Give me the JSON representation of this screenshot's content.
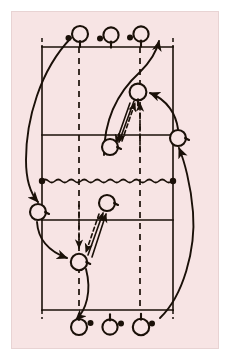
{
  "figure": {
    "kind": "badminton-court-drill-diagram",
    "caption": "",
    "background_color": "#f7e4e4",
    "page_color": "#ffffff",
    "ink_color": "#1a1008",
    "court_line_color": "#1a1008"
  },
  "canvas": {
    "width": 230,
    "height": 360,
    "plate_x": 11,
    "plate_y": 11,
    "plate_width": 208,
    "plate_height": 338
  },
  "court": {
    "left_sideline_x": 42,
    "right_sideline_x": 173,
    "top_baseline_y": 47,
    "bottom_baseline_y": 310,
    "net_y": 181,
    "upper_attack_line_y": 135,
    "lower_attack_line_y": 220,
    "dashed_left_x": 79,
    "dashed_right_x": 140,
    "dash_pattern": "6 5",
    "line_width": 1.6,
    "tick_extension": 9
  },
  "net": {
    "label": "net",
    "y": 181,
    "x_start": 42,
    "x_end": 173,
    "wave_amplitude": 3,
    "wave_period": 13,
    "post_radius": 3.2,
    "post_left_x": 42,
    "post_right_x": 173
  },
  "players": [
    {
      "id": "top-1",
      "role": "queue-player",
      "cx": 80,
      "cy": 34,
      "r": 8.0,
      "handle": "down",
      "shuttle_dot": "left",
      "dot_dx": -11.5,
      "dot_dy": 4.0
    },
    {
      "id": "top-2",
      "role": "queue-player",
      "cx": 111,
      "cy": 35,
      "r": 7.6,
      "handle": "down",
      "shuttle_dot": "left",
      "dot_dx": -11.0,
      "dot_dy": 3.5
    },
    {
      "id": "top-3",
      "role": "queue-player",
      "cx": 141,
      "cy": 34,
      "r": 7.6,
      "handle": "down",
      "shuttle_dot": "left",
      "dot_dx": -11.0,
      "dot_dy": 3.5
    },
    {
      "id": "upper-feeder",
      "role": "feeder",
      "cx": 138,
      "cy": 92,
      "r": 8.4,
      "handle": "down",
      "shuttle_dot": "none",
      "dot_dx": 0,
      "dot_dy": 0
    },
    {
      "id": "upper-worker",
      "role": "worker",
      "cx": 110,
      "cy": 147,
      "r": 8.0,
      "handle": "right",
      "shuttle_dot": "none",
      "dot_dx": 0,
      "dot_dy": 0
    },
    {
      "id": "right-rotator",
      "role": "rotating-player",
      "cx": 178,
      "cy": 138,
      "r": 8.0,
      "handle": "right",
      "shuttle_dot": "none",
      "dot_dx": 0,
      "dot_dy": 0
    },
    {
      "id": "left-rotator",
      "role": "rotating-player",
      "cx": 38,
      "cy": 212,
      "r": 8.0,
      "handle": "right",
      "shuttle_dot": "none",
      "dot_dx": 0,
      "dot_dy": 0
    },
    {
      "id": "lower-feeder",
      "role": "feeder",
      "cx": 107,
      "cy": 203,
      "r": 8.0,
      "handle": "right",
      "shuttle_dot": "none",
      "dot_dx": 0,
      "dot_dy": 0
    },
    {
      "id": "lower-worker",
      "role": "worker",
      "cx": 79,
      "cy": 262,
      "r": 8.2,
      "handle": "right",
      "shuttle_dot": "none",
      "dot_dx": 0,
      "dot_dy": 0
    },
    {
      "id": "bottom-1",
      "role": "queue-player",
      "cx": 79,
      "cy": 327,
      "r": 8.0,
      "handle": "up",
      "shuttle_dot": "right",
      "dot_dx": 11.5,
      "dot_dy": -4.0
    },
    {
      "id": "bottom-2",
      "role": "queue-player",
      "cx": 110,
      "cy": 327,
      "r": 7.6,
      "handle": "up",
      "shuttle_dot": "right",
      "dot_dx": 11.0,
      "dot_dy": -3.5
    },
    {
      "id": "bottom-3",
      "role": "queue-player",
      "cx": 141,
      "cy": 327,
      "r": 8.2,
      "handle": "up",
      "shuttle_dot": "right",
      "dot_dx": 11.0,
      "dot_dy": -3.5
    }
  ],
  "paths": [
    {
      "id": "shot-upper-down",
      "type": "shot-solid",
      "style": "solid",
      "arrow": "end",
      "d": "M 134 101 L 119 142"
    },
    {
      "id": "shot-upper-down-2",
      "type": "shot-solid",
      "style": "solid",
      "arrow": "end",
      "d": "M 130 103 L 116 143"
    },
    {
      "id": "return-upper-up",
      "type": "shot-dashed",
      "style": "dashed",
      "arrow": "end",
      "d": "M 122 141 L 135 103"
    },
    {
      "id": "feed-upper-vertical",
      "type": "shot-dashed",
      "style": "dashed",
      "arrow": "end",
      "d": "M 140 152 L 140 103"
    },
    {
      "id": "shot-lower-up",
      "type": "shot-solid",
      "style": "solid",
      "arrow": "end",
      "d": "M 88 255 L 103 213"
    },
    {
      "id": "shot-lower-up-2",
      "type": "shot-solid",
      "style": "solid",
      "arrow": "end",
      "d": "M 92 257 L 106 214"
    },
    {
      "id": "return-lower-down",
      "type": "shot-dashed",
      "style": "dashed",
      "arrow": "end",
      "d": "M 99 214 L 86 252"
    },
    {
      "id": "feed-lower-vertical",
      "type": "shot-dashed",
      "style": "dashed",
      "arrow": "end",
      "d": "M 79 205 L 79 248"
    },
    {
      "id": "rotation-topleft-to-leftcourt",
      "type": "movement",
      "style": "solid",
      "arrow": "end",
      "d": "M 71 38 C 40 70, 26 120, 26 160 C 26 180, 30 193, 38 202"
    },
    {
      "id": "rotation-upperworker-to-topqueue",
      "type": "movement",
      "style": "solid",
      "arrow": "end",
      "d": "M 104 155 C 104 120, 118 92, 140 72 C 152 60, 157 50, 159 41"
    },
    {
      "id": "rotation-rightrotator-to-upperfeeder",
      "type": "movement",
      "style": "solid",
      "arrow": "end",
      "d": "M 178 129 C 176 115, 168 100, 150 93"
    },
    {
      "id": "rotation-leftrotator-to-lowerworker",
      "type": "movement",
      "style": "solid",
      "arrow": "end",
      "d": "M 37 222 C 38 238, 48 251, 67 258"
    },
    {
      "id": "rotation-lowerworker-to-bottomqueue",
      "type": "movement",
      "style": "solid",
      "arrow": "end",
      "d": "M 86 269 C 92 292, 86 310, 76 320"
    },
    {
      "id": "rotation-bottomqueue-to-rightrotator",
      "type": "movement",
      "style": "solid",
      "arrow": "end",
      "d": "M 160 318 C 183 296, 196 250, 193 212 C 191 185, 184 160, 179 148"
    }
  ],
  "legend": {
    "player_symbol": "racket",
    "shuttle_symbol": "filled-dot",
    "solid_line_meaning": "movement / shot",
    "dashed_line_meaning": "return shot"
  }
}
